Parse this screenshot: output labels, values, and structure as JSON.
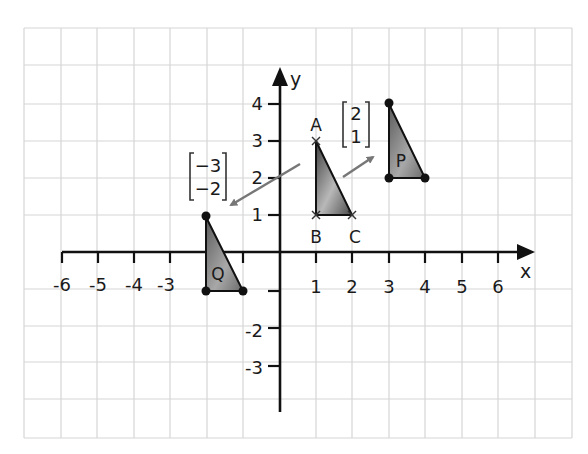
{
  "diagram": {
    "axes": {
      "x_label": "x",
      "y_label": "y",
      "x_ticks": [
        "-6",
        "-5",
        "-4",
        "-3",
        "1",
        "2",
        "3",
        "4",
        "5",
        "6"
      ],
      "y_ticks": [
        "4",
        "3",
        "2",
        "1",
        "-2",
        "-3"
      ],
      "x_range": [
        -6,
        6
      ],
      "y_range": [
        -4,
        4
      ]
    },
    "grid": {
      "on": true,
      "color": "#d4d4d4"
    },
    "shapes": [
      {
        "name": "ABC",
        "vertices": [
          {
            "label": "A",
            "x": 1,
            "y": 3
          },
          {
            "label": "B",
            "x": 1,
            "y": 1
          },
          {
            "label": "C",
            "x": 2,
            "y": 1
          }
        ],
        "marker": "cross"
      },
      {
        "name": "P",
        "label": "P",
        "vertices": [
          {
            "x": 3,
            "y": 4
          },
          {
            "x": 3,
            "y": 2
          },
          {
            "x": 4,
            "y": 2
          }
        ],
        "marker": "dot"
      },
      {
        "name": "Q",
        "label": "Q",
        "vertices": [
          {
            "x": -2,
            "y": 1
          },
          {
            "x": -2,
            "y": -1
          },
          {
            "x": -1,
            "y": -1
          }
        ],
        "marker": "dot"
      }
    ],
    "vectors": [
      {
        "name": "to-P",
        "top": "2",
        "bottom": "1"
      },
      {
        "name": "to-Q",
        "top": "−3",
        "bottom": "−2"
      }
    ],
    "colors": {
      "shape_fill_dark": "#5a5a5a",
      "shape_fill_light": "#d0d0d0",
      "arrow": "#777777",
      "axis": "#111111"
    }
  }
}
